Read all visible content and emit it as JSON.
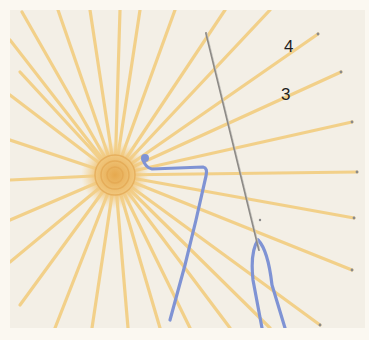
{
  "figure": {
    "labels": [
      {
        "text": "4",
        "x": 284,
        "y": 38
      },
      {
        "text": "3",
        "x": 281,
        "y": 86
      }
    ],
    "colors": {
      "background": "#f3efe6",
      "frame": "#fbf8f1",
      "spoke": "#f2cf85",
      "center": "#eebc6a",
      "working_thread": "#7f93d4",
      "needle": "#8d8a86"
    },
    "wheel_center": {
      "x": 115,
      "y": 175
    }
  }
}
